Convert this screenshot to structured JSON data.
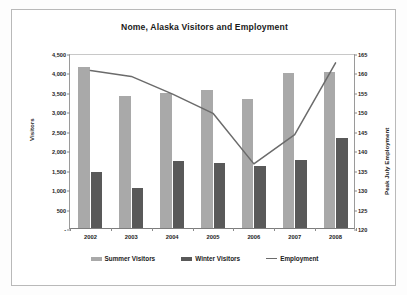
{
  "chart_data": {
    "type": "bar",
    "title": "Nome, Alaska Visitors and Employment",
    "xlabel": "",
    "ylabel": "Visitors",
    "y2label": "Peak July Employment",
    "categories": [
      "2002",
      "2003",
      "2004",
      "2005",
      "2006",
      "2007",
      "2008"
    ],
    "ylim": [
      0,
      4500
    ],
    "y2lim": [
      120,
      165
    ],
    "ytick_labels": [
      "4,500",
      "4,000",
      "3,500",
      "3,000",
      "2,500",
      "2,000",
      "1,500",
      "1,000",
      "500",
      "-"
    ],
    "ytick_values": [
      4500,
      4000,
      3500,
      3000,
      2500,
      2000,
      1500,
      1000,
      500,
      0
    ],
    "y2tick_labels": [
      "165",
      "160",
      "155",
      "150",
      "145",
      "140",
      "135",
      "130",
      "125",
      "120"
    ],
    "y2tick_values": [
      165,
      160,
      155,
      150,
      145,
      140,
      135,
      130,
      125,
      120
    ],
    "grid": false,
    "legend_position": "bottom",
    "series": [
      {
        "name": "Summer Visitors",
        "type": "bar",
        "axis": "left",
        "color": "#a9a9a9",
        "values": [
          4130,
          3390,
          3470,
          3540,
          3320,
          3990,
          4010
        ]
      },
      {
        "name": "Winter Visitors",
        "type": "bar",
        "axis": "left",
        "color": "#595959",
        "values": [
          1430,
          1020,
          1730,
          1670,
          1600,
          1760,
          2310
        ]
      },
      {
        "name": "Employment",
        "type": "line",
        "axis": "right",
        "color": "#6b6b6b",
        "values": [
          161.0,
          159.5,
          155.0,
          150.0,
          137.0,
          144.5,
          163.0
        ]
      }
    ]
  },
  "legend": {
    "items": [
      {
        "label": "Summer Visitors",
        "marker": "bar-swatch-light"
      },
      {
        "label": "Winter Visitors",
        "marker": "bar-swatch-dark"
      },
      {
        "label": "Employment",
        "marker": "line-swatch"
      }
    ]
  }
}
